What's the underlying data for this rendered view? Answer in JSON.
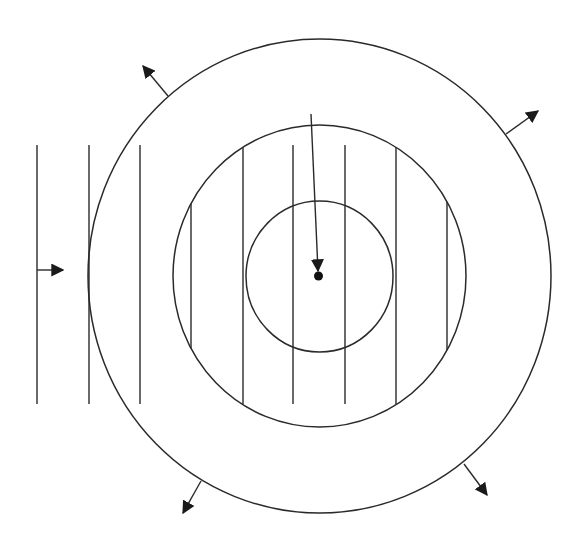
{
  "diagram": {
    "width": 577,
    "height": 545,
    "background": "#ffffff",
    "stroke_color": "#2a2a2a",
    "center": {
      "x": 319.5,
      "y": 276.5
    },
    "circles": [
      {
        "name": "inner",
        "cx": 319.5,
        "cy": 276.5,
        "rx": 73.5,
        "ry": 75.5
      },
      {
        "name": "middle",
        "cx": 319.5,
        "cy": 276,
        "rx": 146.5,
        "ry": 151
      },
      {
        "name": "outer",
        "cx": 319.5,
        "cy": 276,
        "rx": 231.5,
        "ry": 237
      }
    ],
    "vertical_lines": [
      {
        "x": 37,
        "y1": 145,
        "y2": 404
      },
      {
        "x": 89,
        "y1": 145,
        "y2": 404
      },
      {
        "x": 140,
        "y1": 145,
        "y2": 404
      },
      {
        "x": 191,
        "y1": 145,
        "y2": 404
      },
      {
        "x": 243,
        "y1": 146,
        "y2": 404
      },
      {
        "x": 293,
        "y1": 145,
        "y2": 404
      },
      {
        "x": 345,
        "y1": 145,
        "y2": 404
      },
      {
        "x": 396,
        "y1": 146,
        "y2": 404
      },
      {
        "x": 447,
        "y1": 145,
        "y2": 404
      }
    ],
    "incoming_arrow": {
      "x1": 37,
      "y1": 270,
      "x2": 63,
      "y2": 270
    },
    "central_arrow": {
      "x1": 311,
      "y1": 114,
      "x2": 318,
      "y2": 271
    },
    "center_dot": {
      "cx": 318.5,
      "cy": 276,
      "r": 4.5
    },
    "radial_arrows": [
      {
        "name": "top-left",
        "x1": 168,
        "y1": 96,
        "x2": 143,
        "y2": 66
      },
      {
        "name": "top-right",
        "x1": 506,
        "y1": 134,
        "x2": 538,
        "y2": 111
      },
      {
        "name": "bottom-left",
        "x1": 201,
        "y1": 481,
        "x2": 183,
        "y2": 513
      },
      {
        "name": "bottom-right",
        "x1": 464,
        "y1": 464,
        "x2": 487,
        "y2": 495
      }
    ]
  }
}
